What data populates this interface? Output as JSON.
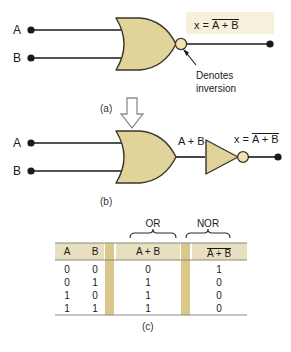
{
  "figure": {
    "colors": {
      "gate_fill": "#e0d49a",
      "gate_stroke": "#3a3428",
      "bubble_fill": "#f0e4b0",
      "wire": "#1a1a1a",
      "highlight_box": "#f7f0da",
      "table_header_fill": "#e8dfc0",
      "table_separator_fill": "#d9c88a",
      "rule": "#8a8a7a"
    },
    "panels": [
      {
        "id": "a",
        "label": "(a)",
        "inputs": [
          "A",
          "B"
        ],
        "gate": "NOR",
        "output_expr": {
          "lead": "x =",
          "operand": "A + B",
          "overline": true
        },
        "annotation": {
          "line1": "Denotes",
          "line2": "inversion"
        }
      },
      {
        "id": "b",
        "label": "(b)",
        "inputs": [
          "A",
          "B"
        ],
        "gates": [
          "OR",
          "NOT"
        ],
        "intermediate_expr": "A + B",
        "output_expr": {
          "lead": "x =",
          "operand": "A + B",
          "overline": true
        }
      },
      {
        "id": "c",
        "label": "(c)",
        "type": "truth-table"
      }
    ],
    "transition_arrow": "down-arrow-outline"
  },
  "truth_table": {
    "group_labels": [
      "OR",
      "NOR"
    ],
    "headers": [
      {
        "text": "A",
        "overline": false
      },
      {
        "text": "B",
        "overline": false
      },
      {
        "text": "A + B",
        "overline": false
      },
      {
        "text": "A + B",
        "overline": true
      }
    ],
    "rows": [
      [
        "0",
        "0",
        "0",
        "1"
      ],
      [
        "0",
        "1",
        "1",
        "0"
      ],
      [
        "1",
        "0",
        "1",
        "0"
      ],
      [
        "1",
        "1",
        "1",
        "0"
      ]
    ]
  }
}
